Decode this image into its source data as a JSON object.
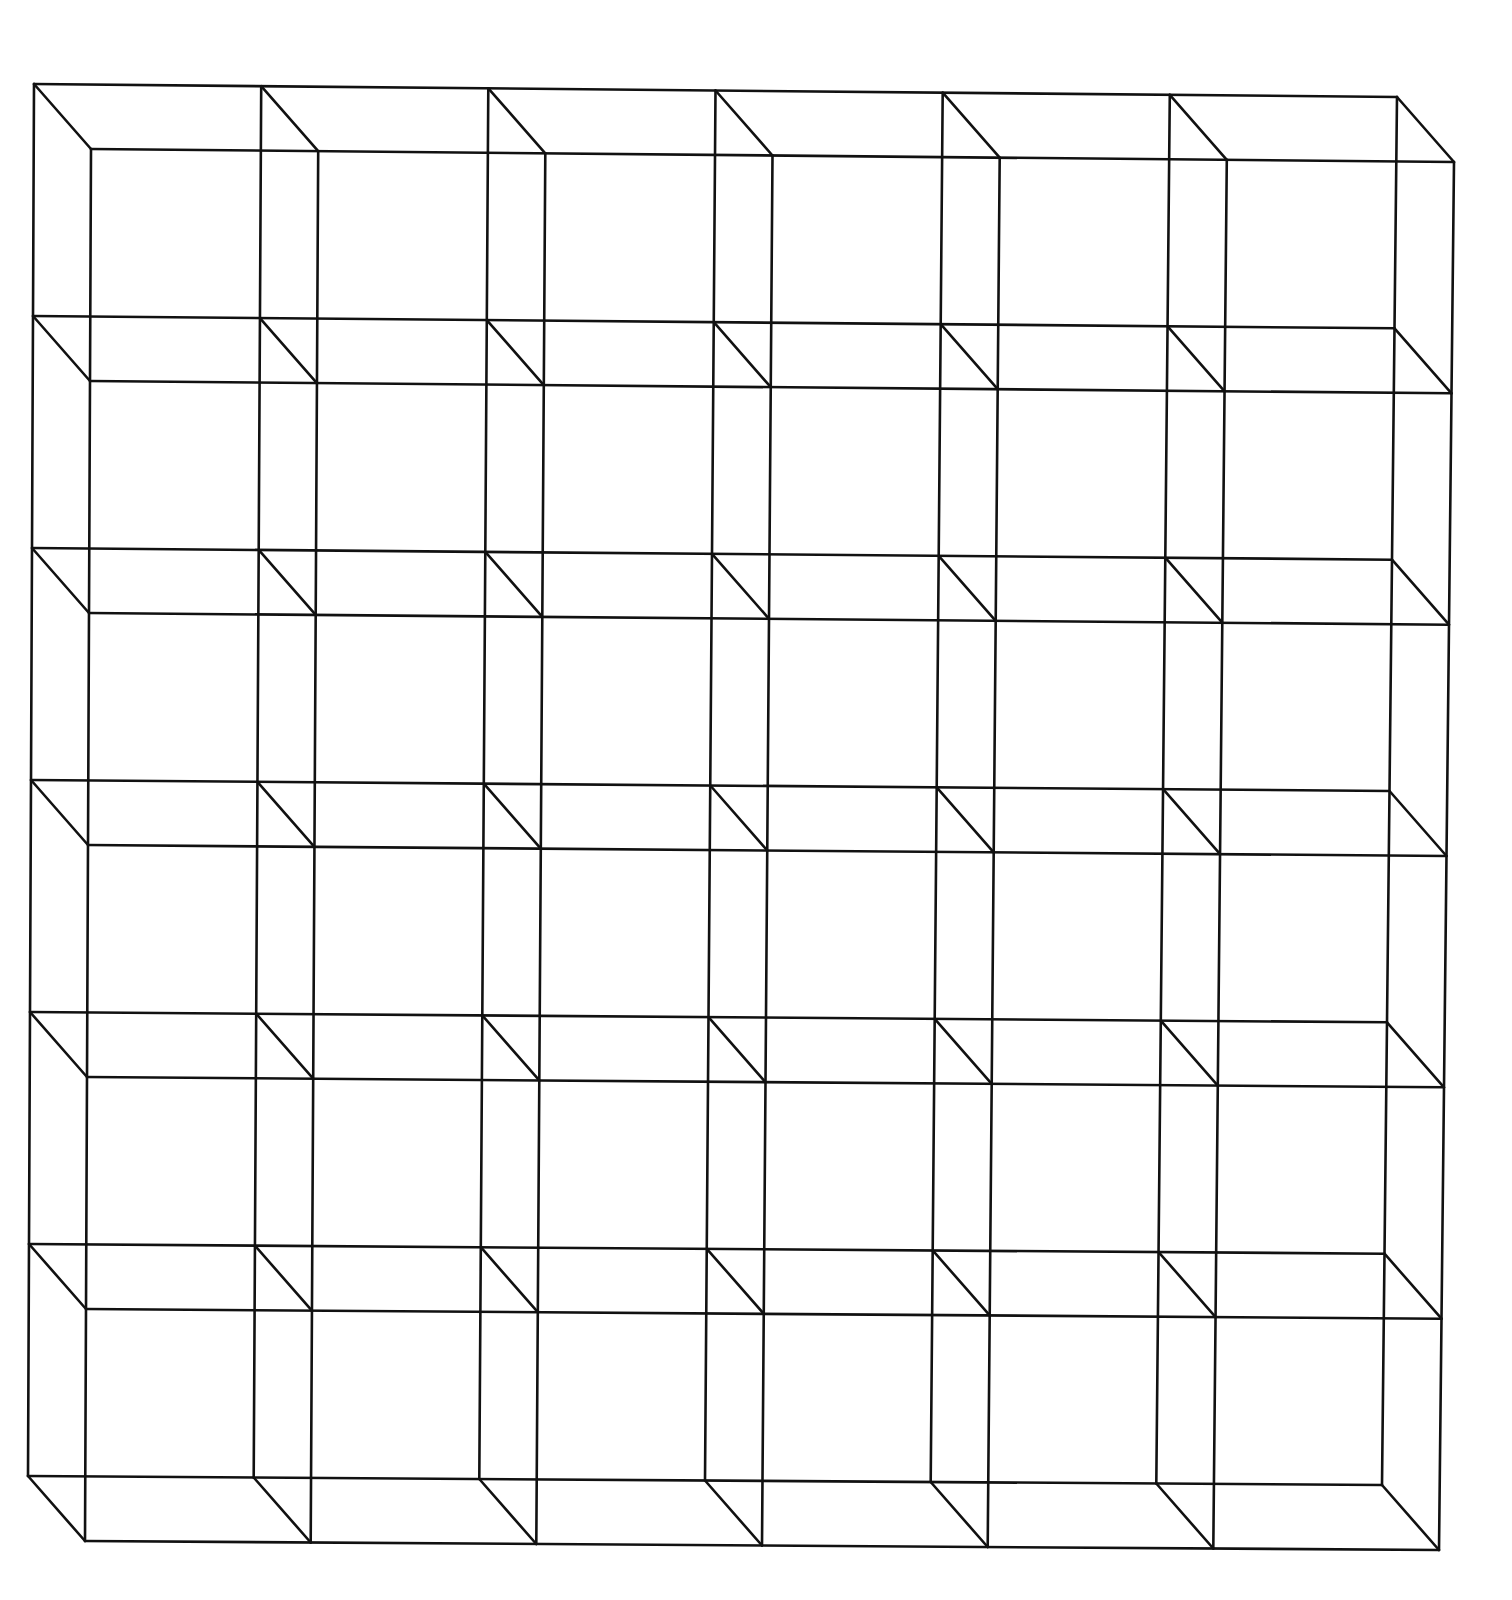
{
  "figure": {
    "grid": {
      "columns": 6,
      "rows": 6
    },
    "back_plane_corners": {
      "top_left": [
        34,
        84
      ],
      "top_right": [
        1397,
        97
      ],
      "bottom_left": [
        28,
        1476
      ],
      "bottom_right": [
        1382,
        1485
      ]
    },
    "front_offset": [
      57,
      65
    ],
    "stroke_color": "#111111",
    "background_color": "#ffffff",
    "stroke_width": 2.6
  }
}
